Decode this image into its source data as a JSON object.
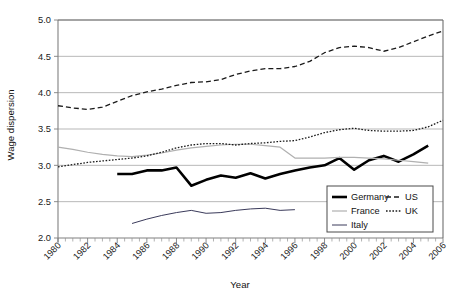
{
  "chart_data": {
    "type": "line",
    "title": "",
    "xlabel": "Year",
    "ylabel": "Wage dispersion",
    "xlim": [
      1980,
      2006
    ],
    "ylim": [
      2.0,
      5.0
    ],
    "ytick_labels": [
      "2.0",
      "2.5",
      "3.0",
      "3.5",
      "4.0",
      "4.5",
      "5.0"
    ],
    "ytick_values": [
      2.0,
      2.5,
      3.0,
      3.5,
      4.0,
      4.5,
      5.0
    ],
    "xtick_labels": [
      "1980",
      "1982",
      "1984",
      "1986",
      "1988",
      "1990",
      "1992",
      "1994",
      "1996",
      "1998",
      "2000",
      "2002",
      "2004",
      "2006"
    ],
    "xtick_values": [
      1980,
      1982,
      1984,
      1986,
      1988,
      1990,
      1992,
      1994,
      1996,
      1998,
      2000,
      2002,
      2004,
      2006
    ],
    "grid": "horizontal",
    "legend_position": "bottom-right",
    "series": [
      {
        "name": "Germany",
        "style": "solid-thick",
        "color": "#000000",
        "x": [
          1984,
          1985,
          1986,
          1987,
          1988,
          1989,
          1990,
          1991,
          1992,
          1993,
          1994,
          1995,
          1996,
          1997,
          1998,
          1999,
          2000,
          2001,
          2002,
          2003,
          2004,
          2005
        ],
        "values": [
          2.88,
          2.88,
          2.93,
          2.93,
          2.97,
          2.72,
          2.8,
          2.86,
          2.83,
          2.89,
          2.82,
          2.88,
          2.93,
          2.97,
          3.0,
          3.1,
          2.94,
          3.07,
          3.13,
          3.05,
          3.15,
          3.27
        ]
      },
      {
        "name": "France",
        "style": "solid-light",
        "color": "#b0b0b0",
        "x": [
          1980,
          1981,
          1982,
          1983,
          1984,
          1985,
          1986,
          1987,
          1988,
          1989,
          1990,
          1991,
          1992,
          1993,
          1994,
          1995,
          1996,
          1997,
          1998,
          1999,
          2000,
          2001,
          2002,
          2003,
          2004,
          2005
        ],
        "values": [
          3.25,
          3.22,
          3.18,
          3.15,
          3.13,
          3.12,
          3.14,
          3.17,
          3.21,
          3.24,
          3.26,
          3.28,
          3.29,
          3.29,
          3.27,
          3.25,
          3.1,
          3.1,
          3.1,
          3.11,
          3.11,
          3.1,
          3.09,
          3.07,
          3.05,
          3.03
        ]
      },
      {
        "name": "Italy",
        "style": "solid-thin",
        "color": "#3a3a5a",
        "x": [
          1985,
          1986,
          1987,
          1988,
          1989,
          1990,
          1991,
          1992,
          1993,
          1994,
          1995,
          1996
        ],
        "values": [
          2.2,
          2.26,
          2.31,
          2.35,
          2.38,
          2.34,
          2.35,
          2.38,
          2.4,
          2.41,
          2.38,
          2.39
        ]
      },
      {
        "name": "US",
        "style": "dashed",
        "color": "#1a1a1a",
        "x": [
          1980,
          1981,
          1982,
          1983,
          1984,
          1985,
          1986,
          1987,
          1988,
          1989,
          1990,
          1991,
          1992,
          1993,
          1994,
          1995,
          1996,
          1997,
          1998,
          1999,
          2000,
          2001,
          2002,
          2003,
          2004,
          2005,
          2006
        ],
        "values": [
          3.82,
          3.79,
          3.77,
          3.8,
          3.88,
          3.96,
          4.01,
          4.05,
          4.1,
          4.14,
          4.15,
          4.18,
          4.25,
          4.3,
          4.33,
          4.33,
          4.36,
          4.43,
          4.55,
          4.62,
          4.64,
          4.62,
          4.57,
          4.62,
          4.7,
          4.78,
          4.85
        ]
      },
      {
        "name": "UK",
        "style": "dotted",
        "color": "#1a1a1a",
        "x": [
          1980,
          1981,
          1982,
          1983,
          1984,
          1985,
          1986,
          1987,
          1988,
          1989,
          1990,
          1991,
          1992,
          1993,
          1994,
          1995,
          1996,
          1997,
          1998,
          1999,
          2000,
          2001,
          2002,
          2003,
          2004,
          2005,
          2006
        ],
        "values": [
          2.98,
          3.01,
          3.04,
          3.06,
          3.08,
          3.1,
          3.13,
          3.18,
          3.24,
          3.28,
          3.3,
          3.3,
          3.28,
          3.3,
          3.31,
          3.33,
          3.34,
          3.39,
          3.45,
          3.49,
          3.51,
          3.48,
          3.47,
          3.47,
          3.48,
          3.53,
          3.62
        ]
      }
    ]
  },
  "legend": {
    "entries": [
      {
        "label": "Germany",
        "style": "solid-thick"
      },
      {
        "label": "US",
        "style": "dashed"
      },
      {
        "label": "France",
        "style": "solid-light"
      },
      {
        "label": "UK",
        "style": "dotted"
      },
      {
        "label": "Italy",
        "style": "solid-thin"
      }
    ]
  }
}
